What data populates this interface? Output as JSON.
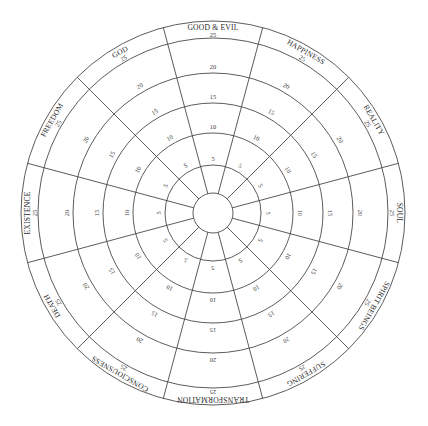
{
  "diagram": {
    "type": "radial-wheel",
    "center": [
      213,
      213
    ],
    "rings": [
      {
        "value": 0,
        "radius": 20
      },
      {
        "value": 5,
        "radius": 48
      },
      {
        "value": 10,
        "radius": 80
      },
      {
        "value": 15,
        "radius": 110
      },
      {
        "value": 20,
        "radius": 140
      },
      {
        "value": 25,
        "radius": 175
      },
      {
        "value": null,
        "radius": 192
      }
    ],
    "scale_labels": [
      "5",
      "10",
      "15",
      "20",
      "25"
    ],
    "segments": [
      {
        "name": "GOOD & EVIL",
        "angle": 0
      },
      {
        "name": "HAPPINESS",
        "angle": 30
      },
      {
        "name": "REALITY",
        "angle": 60
      },
      {
        "name": "SOUL",
        "angle": 90
      },
      {
        "name": "SPIRIT BEINGS",
        "angle": 120
      },
      {
        "name": "SUFFERING",
        "angle": 150
      },
      {
        "name": "TRANSFORMATION",
        "angle": 180
      },
      {
        "name": "CONSCIOUSNESS",
        "angle": 210
      },
      {
        "name": "DEATH",
        "angle": 240
      },
      {
        "name": "EXISTENCE",
        "angle": 270
      },
      {
        "name": "FREEDOM",
        "angle": 300
      },
      {
        "name": "GOD",
        "angle": 330
      }
    ],
    "colors": {
      "line": "#4a4a4a",
      "text": "#2a2a2a",
      "background": "#ffffff"
    }
  }
}
